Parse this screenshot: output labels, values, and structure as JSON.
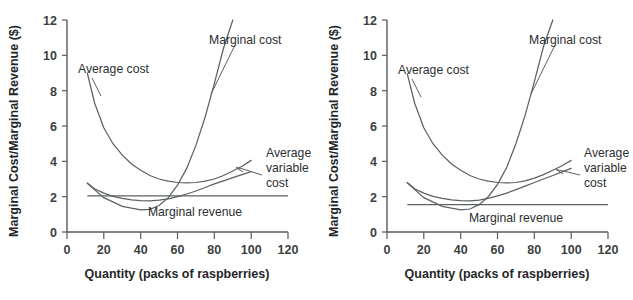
{
  "figure": {
    "panels": [
      {
        "id": "left-panel",
        "name": "cost-revenue-chart-left",
        "x_axis_title": "Quantity (packs of raspberries)",
        "y_axis_title": "Marginal Cost/Marginal Revenue ($)",
        "labels": {
          "average_cost": "Average cost",
          "marginal_cost": "Marginal cost",
          "average_variable_cost_line1": "Average",
          "average_variable_cost_line2": "variable",
          "average_variable_cost_line3": "cost",
          "marginal_revenue": "Marginal revenue"
        },
        "x_ticks": [
          "0",
          "20",
          "40",
          "60",
          "80",
          "100",
          "120"
        ],
        "y_ticks": [
          "0",
          "2",
          "4",
          "6",
          "8",
          "10",
          "12"
        ]
      },
      {
        "id": "right-panel",
        "name": "cost-revenue-chart-right",
        "x_axis_title": "Quantity (packs of raspberries)",
        "y_axis_title": "Marginal Cost/Marginal Revenue ($)",
        "labels": {
          "average_cost": "Average cost",
          "marginal_cost": "Marginal cost",
          "average_variable_cost_line1": "Average",
          "average_variable_cost_line2": "variable",
          "average_variable_cost_line3": "cost",
          "marginal_revenue": "Marginal revenue"
        },
        "x_ticks": [
          "0",
          "20",
          "40",
          "60",
          "80",
          "100",
          "120"
        ],
        "y_ticks": [
          "0",
          "2",
          "4",
          "6",
          "8",
          "10",
          "12"
        ]
      }
    ]
  },
  "chart_data": [
    {
      "type": "line",
      "title": "",
      "xlabel": "Quantity (packs of raspberries)",
      "ylabel": "Marginal Cost/Marginal Revenue ($)",
      "xlim": [
        0,
        120
      ],
      "ylim": [
        0,
        12
      ],
      "xticks": [
        0,
        20,
        40,
        60,
        80,
        100,
        120
      ],
      "yticks": [
        0,
        2,
        4,
        6,
        8,
        10,
        12
      ],
      "grid": false,
      "legend": "annotations-on-curves",
      "series": [
        {
          "name": "Average cost",
          "x": [
            11,
            15,
            20,
            25,
            30,
            35,
            40,
            45,
            50,
            55,
            60,
            65,
            70,
            75,
            80,
            85,
            90,
            95,
            100
          ],
          "y": [
            9.0,
            7.3,
            5.9,
            5.0,
            4.35,
            3.85,
            3.5,
            3.2,
            3.0,
            2.88,
            2.8,
            2.78,
            2.8,
            2.88,
            3.0,
            3.2,
            3.45,
            3.72,
            4.05
          ]
        },
        {
          "name": "Marginal cost",
          "x": [
            11,
            20,
            30,
            40,
            45,
            50,
            55,
            60,
            65,
            70,
            75,
            80,
            85,
            90
          ],
          "y": [
            2.75,
            1.95,
            1.45,
            1.25,
            1.28,
            1.5,
            1.95,
            2.65,
            3.6,
            4.9,
            6.5,
            8.4,
            10.4,
            12.0
          ]
        },
        {
          "name": "Average variable cost",
          "x": [
            11,
            15,
            20,
            25,
            30,
            35,
            40,
            45,
            50,
            55,
            60,
            65,
            70,
            75,
            80,
            85,
            90,
            95,
            100
          ],
          "y": [
            2.78,
            2.45,
            2.2,
            2.02,
            1.9,
            1.82,
            1.78,
            1.76,
            1.8,
            1.88,
            2.0,
            2.15,
            2.32,
            2.52,
            2.72,
            2.9,
            3.08,
            3.25,
            3.42
          ]
        },
        {
          "name": "Marginal revenue",
          "x": [
            11,
            120
          ],
          "y": [
            2.05,
            2.05
          ]
        }
      ],
      "annotations": [
        {
          "text": "Average cost",
          "x": 22,
          "y": 9.8
        },
        {
          "text": "Marginal cost",
          "x": 78,
          "y": 11.3
        },
        {
          "text": "Average variable cost",
          "x": 104,
          "y": 4.0
        },
        {
          "text": "Marginal revenue",
          "x": 68,
          "y": 1.45
        }
      ]
    },
    {
      "type": "line",
      "title": "",
      "xlabel": "Quantity (packs of raspberries)",
      "ylabel": "Marginal Cost/Marginal Revenue ($)",
      "xlim": [
        0,
        120
      ],
      "ylim": [
        0,
        12
      ],
      "xticks": [
        0,
        20,
        40,
        60,
        80,
        100,
        120
      ],
      "yticks": [
        0,
        2,
        4,
        6,
        8,
        10,
        12
      ],
      "grid": false,
      "legend": "annotations-on-curves",
      "series": [
        {
          "name": "Average cost",
          "x": [
            11,
            15,
            20,
            25,
            30,
            35,
            40,
            45,
            50,
            55,
            60,
            65,
            70,
            75,
            80,
            85,
            90,
            95,
            100
          ],
          "y": [
            8.95,
            7.3,
            5.9,
            5.0,
            4.35,
            3.85,
            3.5,
            3.2,
            3.0,
            2.88,
            2.8,
            2.78,
            2.8,
            2.9,
            3.05,
            3.25,
            3.5,
            3.75,
            4.05
          ]
        },
        {
          "name": "Marginal cost",
          "x": [
            11,
            20,
            30,
            40,
            45,
            50,
            55,
            60,
            65,
            70,
            75,
            80,
            85,
            90
          ],
          "y": [
            2.78,
            1.95,
            1.45,
            1.25,
            1.3,
            1.55,
            2.0,
            2.7,
            3.65,
            5.0,
            6.6,
            8.5,
            10.5,
            12.0
          ]
        },
        {
          "name": "Average variable cost",
          "x": [
            11,
            15,
            20,
            25,
            30,
            35,
            40,
            45,
            50,
            55,
            60,
            65,
            70,
            75,
            80,
            85,
            90,
            95,
            100
          ],
          "y": [
            2.8,
            2.45,
            2.2,
            2.02,
            1.9,
            1.82,
            1.78,
            1.76,
            1.8,
            1.9,
            2.05,
            2.2,
            2.4,
            2.6,
            2.8,
            3.0,
            3.2,
            3.4,
            3.6
          ]
        },
        {
          "name": "Marginal revenue",
          "x": [
            11,
            120
          ],
          "y": [
            1.55,
            1.55
          ]
        }
      ],
      "annotations": [
        {
          "text": "Average cost",
          "x": 22,
          "y": 9.8
        },
        {
          "text": "Marginal cost",
          "x": 78,
          "y": 11.3
        },
        {
          "text": "Average variable cost",
          "x": 104,
          "y": 4.0
        },
        {
          "text": "Marginal revenue",
          "x": 68,
          "y": 1.0
        }
      ]
    }
  ]
}
